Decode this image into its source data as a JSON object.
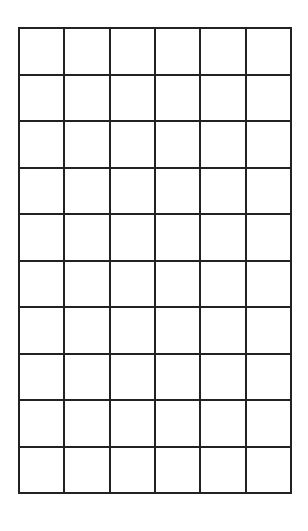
{
  "grid": {
    "columns": 6,
    "rows": 10,
    "line_color": "#222222",
    "background_color": "#ffffff",
    "cells_content": "empty"
  }
}
